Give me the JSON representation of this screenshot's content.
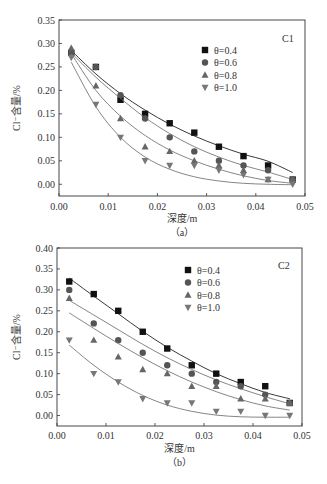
{
  "chart_data": [
    {
      "type": "scatter",
      "panel": "(a)",
      "title": "C1",
      "xlabel": "深度/m",
      "ylabel": "Cl⁻含量/%",
      "xlim": [
        0.0,
        0.05
      ],
      "ylim": [
        -0.025,
        0.35
      ],
      "xticks": [
        "0.00",
        "0.01",
        "0.02",
        "0.03",
        "0.04",
        "0.05"
      ],
      "yticks": [
        "0.00",
        "0.05",
        "0.10",
        "0.15",
        "0.20",
        "0.25",
        "0.30",
        "0.35"
      ],
      "grid": false,
      "legend_position": "upper-right-inside",
      "x": [
        0.0025,
        0.0075,
        0.0125,
        0.0175,
        0.0225,
        0.0275,
        0.0325,
        0.0375,
        0.0425,
        0.0475
      ],
      "series": [
        {
          "name": "θ=0.4",
          "marker": "square",
          "values": [
            0.28,
            0.25,
            0.18,
            0.15,
            0.13,
            0.11,
            0.08,
            0.06,
            0.04,
            0.01
          ],
          "fit": [
            0.285,
            0.235,
            0.193,
            0.158,
            0.128,
            0.103,
            0.082,
            0.064,
            0.049,
            0.025
          ]
        },
        {
          "name": "θ=0.6",
          "marker": "circle",
          "values": [
            0.28,
            0.25,
            0.19,
            0.14,
            0.1,
            0.07,
            0.05,
            0.04,
            0.03,
            0.01
          ],
          "fit": [
            0.28,
            0.228,
            0.183,
            0.142,
            0.108,
            0.08,
            0.058,
            0.04,
            0.026,
            0.01
          ]
        },
        {
          "name": "θ=0.8",
          "marker": "triangle-up",
          "values": [
            0.29,
            0.21,
            0.14,
            0.08,
            0.07,
            0.05,
            0.04,
            0.03,
            0.01,
            0.01
          ],
          "fit": [
            0.278,
            0.2,
            0.145,
            0.104,
            0.073,
            0.05,
            0.032,
            0.018,
            0.008,
            0.002
          ]
        },
        {
          "name": "θ=1.0",
          "marker": "triangle-down",
          "values": [
            0.27,
            0.17,
            0.1,
            0.05,
            0.04,
            0.04,
            0.03,
            0.02,
            0.01,
            0.0
          ],
          "fit": [
            0.26,
            0.165,
            0.1,
            0.058,
            0.032,
            0.016,
            0.007,
            0.002,
            0.0,
            -0.001
          ]
        }
      ]
    },
    {
      "type": "scatter",
      "panel": "(b)",
      "title": "C2",
      "xlabel": "深度/m",
      "ylabel": "Cl⁻含量/%",
      "xlim": [
        0.0,
        0.05
      ],
      "ylim": [
        -0.025,
        0.4
      ],
      "xticks": [
        "0.00",
        "0.01",
        "0.02",
        "0.03",
        "0.04",
        "0.05"
      ],
      "yticks": [
        "0.00",
        "0.05",
        "0.10",
        "0.15",
        "0.20",
        "0.25",
        "0.30",
        "0.35",
        "0.40"
      ],
      "grid": false,
      "legend_position": "upper-right-inside",
      "x": [
        0.0025,
        0.0075,
        0.0125,
        0.0175,
        0.0225,
        0.0275,
        0.0325,
        0.0375,
        0.0425,
        0.0475
      ],
      "series": [
        {
          "name": "θ=0.4",
          "marker": "square",
          "values": [
            0.32,
            0.29,
            0.25,
            0.2,
            0.16,
            0.12,
            0.1,
            0.08,
            0.07,
            0.03
          ],
          "fit": [
            0.328,
            0.285,
            0.243,
            0.201,
            0.163,
            0.13,
            0.1,
            0.076,
            0.055,
            0.04
          ]
        },
        {
          "name": "θ=0.6",
          "marker": "circle",
          "values": [
            0.3,
            0.22,
            0.18,
            0.15,
            0.12,
            0.1,
            0.08,
            0.07,
            0.05,
            0.03
          ],
          "fit": [
            0.275,
            0.24,
            0.205,
            0.17,
            0.138,
            0.11,
            0.085,
            0.064,
            0.045,
            0.028
          ]
        },
        {
          "name": "θ=0.8",
          "marker": "triangle-up",
          "values": [
            0.28,
            0.18,
            0.14,
            0.11,
            0.1,
            0.07,
            0.07,
            0.04,
            0.04,
            0.03
          ],
          "fit": [
            0.245,
            0.208,
            0.172,
            0.138,
            0.107,
            0.08,
            0.057,
            0.038,
            0.023,
            0.013
          ]
        },
        {
          "name": "θ=1.0",
          "marker": "triangle-down",
          "values": [
            0.18,
            0.1,
            0.08,
            0.04,
            0.03,
            0.03,
            0.01,
            0.01,
            0.0,
            0.0
          ],
          "fit": [
            0.168,
            0.12,
            0.08,
            0.048,
            0.025,
            0.01,
            0.001,
            -0.003,
            -0.004,
            -0.004
          ]
        }
      ]
    }
  ],
  "panels": [
    {
      "label": "（a）",
      "tag": "C1",
      "xlabel": "深度/m",
      "ylabel": "Cl⁻含量/%"
    },
    {
      "label": "（b）",
      "tag": "C2",
      "xlabel": "深度/m",
      "ylabel": "Cl⁻含量/%"
    }
  ],
  "colors": {
    "θ=0.4": "#111111",
    "θ=0.6": "#555555",
    "θ=0.8": "#666666",
    "θ=1.0": "#777777",
    "fit_line": "#444444",
    "axis": "#333333"
  }
}
